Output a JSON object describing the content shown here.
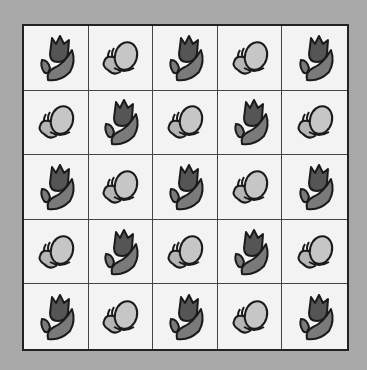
{
  "puzzle": {
    "rows": 5,
    "cols": 5,
    "cells": [
      [
        "tulip",
        "butterfly",
        "tulip",
        "butterfly",
        "tulip"
      ],
      [
        "butterfly",
        "tulip",
        "butterfly",
        "tulip",
        "butterfly"
      ],
      [
        "tulip",
        "butterfly",
        "tulip",
        "butterfly",
        "tulip"
      ],
      [
        "butterfly",
        "tulip",
        "butterfly",
        "tulip",
        "butterfly"
      ],
      [
        "tulip",
        "butterfly",
        "tulip",
        "butterfly",
        "tulip"
      ]
    ]
  },
  "colors": {
    "background": "#a9a9a9",
    "cell": "#f3f3f3",
    "tulip_head": "#555555",
    "tulip_leaf": "#7a7a7a",
    "butterfly_wing": "#c6c6c6",
    "butterfly_small_wing": "#b5b5b5",
    "outline": "#1a1a1a"
  }
}
